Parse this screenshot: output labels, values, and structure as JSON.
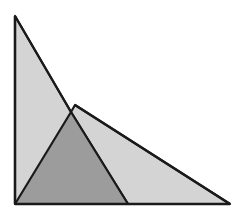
{
  "diagram": {
    "colors": {
      "light_fill": "#d4d4d4",
      "dark_fill": "#9c9c9c",
      "stroke": "#1a1a1a",
      "background": "#ffffff"
    },
    "shapes": [
      {
        "id": "left-right-triangle",
        "fill": "light_fill"
      },
      {
        "id": "right-triangle",
        "fill": "light_fill"
      },
      {
        "id": "inner-shaded-triangle",
        "fill": "dark_fill"
      }
    ]
  }
}
